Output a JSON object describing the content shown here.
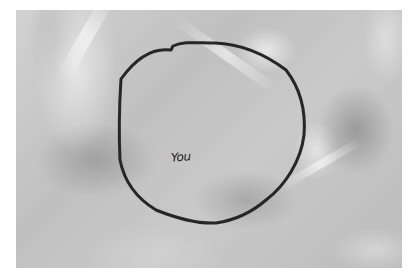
{
  "image": {
    "description": "Grayscale photo of crumpled paper/fabric with a hand-drawn circle",
    "annotation": {
      "shape": "circle",
      "stroke_color": "#262626",
      "label": "You"
    },
    "colors": {
      "background_margin": "#ffffff",
      "surface_mid": "#c4c4c4",
      "surface_light": "#e0e0e0",
      "surface_dark": "#9a9a9a",
      "ink": "#262626"
    }
  }
}
